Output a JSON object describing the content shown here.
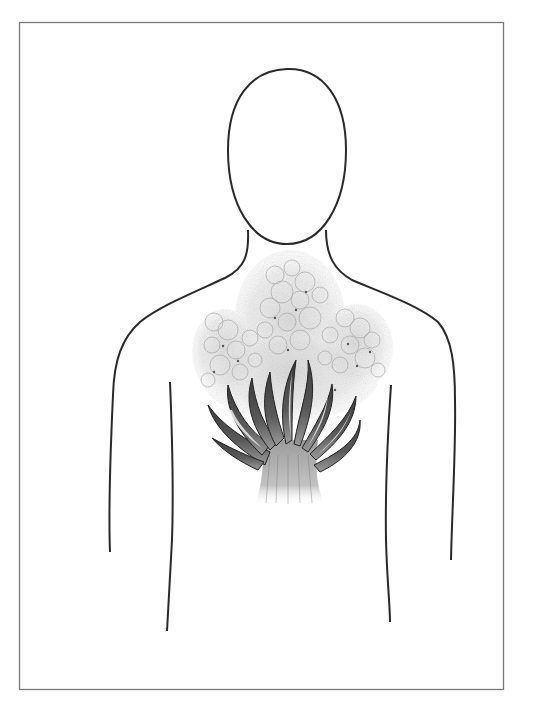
{
  "illustration": {
    "title": "",
    "subject": "human-bust-outline-with-flames-in-chest",
    "elements": [
      "frame-border",
      "head-outline",
      "neck-and-shoulders-outline",
      "arm-lines",
      "torso-lines",
      "smoke-cloud",
      "flame-plant"
    ]
  },
  "colors": {
    "background": "#ffffff",
    "frame": "#7a7a7a",
    "outline": "#2a2a2a",
    "flame_dark": "#2b2b2b",
    "flame_mid": "#6e6e6e",
    "flame_light": "#bdbdbd",
    "smoke": "#9a9a9a",
    "smoke_fill": "#d8d8d8"
  }
}
